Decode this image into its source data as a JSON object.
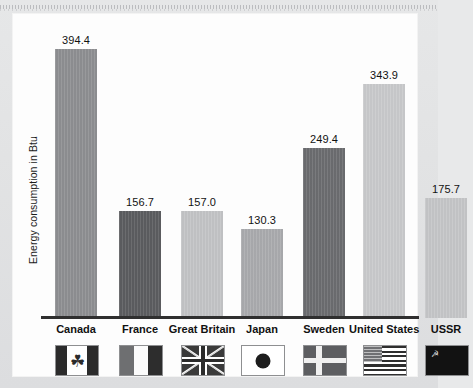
{
  "chart_data": {
    "type": "bar",
    "title": "",
    "xlabel": "",
    "ylabel": "Energy consumption in Btu",
    "categories": [
      "Canada",
      "France",
      "Great Britain",
      "Japan",
      "Sweden",
      "United States",
      "USSR"
    ],
    "values": [
      394.4,
      156.7,
      157.0,
      130.3,
      249.4,
      343.9,
      175.7
    ],
    "value_labels": [
      "394.4",
      "156.7",
      "157.0",
      "130.3",
      "249.4",
      "343.9",
      "175.7"
    ],
    "ylim": [
      0,
      420
    ],
    "grid": false,
    "legend": "none",
    "bar_colors": [
      "#8d8e91",
      "#5b5c5f",
      "#c2c3c5",
      "#a9aaad",
      "#6b6c6f",
      "#c8c9cb",
      "#c4c5c7"
    ],
    "series": [
      {
        "name": "Energy consumption in Btu",
        "values": [
          394.4,
          156.7,
          157.0,
          130.3,
          249.4,
          343.9,
          175.7
        ]
      }
    ],
    "points": [
      {
        "category": "Canada",
        "value": 394.4,
        "label": "394.4",
        "flag": "canada-flag-icon"
      },
      {
        "category": "France",
        "value": 156.7,
        "label": "156.7",
        "flag": "france-flag-icon"
      },
      {
        "category": "Great Britain",
        "value": 157.0,
        "label": "157.0",
        "flag": "great-britain-flag-icon"
      },
      {
        "category": "Japan",
        "value": 130.3,
        "label": "130.3",
        "flag": "japan-flag-icon"
      },
      {
        "category": "Sweden",
        "value": 249.4,
        "label": "249.4",
        "flag": "sweden-flag-icon"
      },
      {
        "category": "United States",
        "value": 343.9,
        "label": "343.9",
        "flag": "united-states-flag-icon"
      },
      {
        "category": "USSR",
        "value": 175.7,
        "label": "175.7",
        "flag": "ussr-flag-icon"
      }
    ]
  },
  "axis": {
    "y_title": "Energy consumption in Btu"
  },
  "flags": {
    "canada_leaf_glyph": "☘",
    "ussr_emblem_glyph": "☭"
  }
}
